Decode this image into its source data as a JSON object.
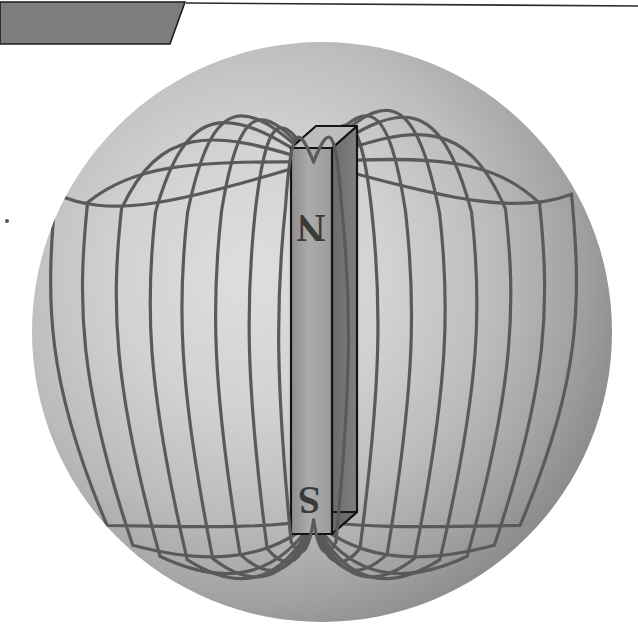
{
  "canvas": {
    "width": 638,
    "height": 640,
    "background_color": "#ffffff",
    "title": "Magnetic field of a bar magnet"
  },
  "banner": {
    "name": "top-left-parallelogram",
    "fill_color": "#7d7d7d",
    "stroke_color": "#1c1c1c",
    "points": "0,2 185,2 170,44 0,44",
    "rule_line": {
      "name": "header-rule",
      "x1": 186,
      "y1": 3,
      "x2": 638,
      "y2": 6,
      "color": "#2b2b2b",
      "width": 1.6
    }
  },
  "artifact_dot": {
    "name": "stray-dot",
    "cx": 7,
    "cy": 221,
    "r": 2,
    "color": "#555555"
  },
  "sphere": {
    "name": "field-sphere",
    "cx": 322,
    "cy": 332,
    "r": 290,
    "center_color": "#d8d8d8",
    "mid_color": "#b4b4b4",
    "edge_color": "#808080",
    "highlight_x": "38%",
    "highlight_y": "40%"
  },
  "magnet": {
    "name": "bar-magnet",
    "top_y": 148,
    "bottom_y": 534,
    "front_left_x": 291,
    "front_right_x": 332,
    "side_right_x": 357,
    "depth_dy": -22,
    "front_fill": "#a6a6a6",
    "side_fill": "#6f6f6f",
    "top_fill": "#bdbdbd",
    "outline_color": "#141414",
    "outline_width": 2.2,
    "north_label": "N",
    "south_label": "S",
    "label_color": "#3a3a3a",
    "north_label_x": 311,
    "north_label_y": 215,
    "south_label_x": 309,
    "south_label_y": 487
  },
  "field_lines": {
    "name": "magnetic-field-lines",
    "stroke_color": "#5a5a5a",
    "stroke_width": 3.2,
    "count": 16,
    "description": "Closed dipole loops emerging from the north pole at the top of the bar magnet and re-entering at the south pole at the bottom, drawn on both the left and right sides.",
    "left_loops": [
      {
        "id": "L1",
        "half_width": 28,
        "top_extent": 118,
        "bottom_extent": 560
      },
      {
        "id": "L2",
        "half_width": 58,
        "top_extent": 104,
        "bottom_extent": 572
      },
      {
        "id": "L3",
        "half_width": 92,
        "top_extent": 92,
        "bottom_extent": 582
      },
      {
        "id": "L4",
        "half_width": 126,
        "top_extent": 86,
        "bottom_extent": 590
      },
      {
        "id": "L5",
        "half_width": 158,
        "top_extent": 96,
        "bottom_extent": 592
      },
      {
        "id": "L6",
        "half_width": 192,
        "top_extent": 122,
        "bottom_extent": 586
      },
      {
        "id": "L7",
        "half_width": 226,
        "top_extent": 160,
        "bottom_extent": 566
      },
      {
        "id": "L8",
        "half_width": 258,
        "top_extent": 212,
        "bottom_extent": 530
      }
    ],
    "right_loops": [
      {
        "id": "R1",
        "half_width": 28,
        "top_extent": 118,
        "bottom_extent": 560
      },
      {
        "id": "R2",
        "half_width": 58,
        "top_extent": 100,
        "bottom_extent": 572
      },
      {
        "id": "R3",
        "half_width": 92,
        "top_extent": 86,
        "bottom_extent": 582
      },
      {
        "id": "R4",
        "half_width": 126,
        "top_extent": 78,
        "bottom_extent": 590
      },
      {
        "id": "R5",
        "half_width": 158,
        "top_extent": 88,
        "bottom_extent": 592
      },
      {
        "id": "R6",
        "half_width": 192,
        "top_extent": 114,
        "bottom_extent": 586
      },
      {
        "id": "R7",
        "half_width": 226,
        "top_extent": 154,
        "bottom_extent": 566
      },
      {
        "id": "R8",
        "half_width": 258,
        "top_extent": 208,
        "bottom_extent": 530
      }
    ]
  }
}
